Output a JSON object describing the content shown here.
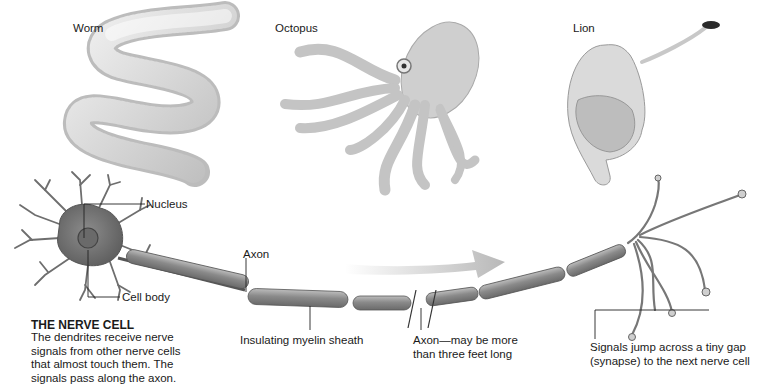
{
  "animals": {
    "worm": {
      "label": "Worm"
    },
    "octopus": {
      "label": "Octopus"
    },
    "lion": {
      "label": "Lion"
    }
  },
  "nerve_cell": {
    "labels": {
      "nucleus": "Nucleus",
      "cell_body": "Cell body",
      "axon": "Axon",
      "myelin": "Insulating myelin sheath",
      "axon_length_line1": "Axon—may be more",
      "axon_length_line2": "than three feet long",
      "synapse_line1": "Signals jump across a tiny gap",
      "synapse_line2": "(synapse) to the next nerve cell"
    },
    "caption": {
      "title": "THE NERVE CELL",
      "lines": [
        "The dendrites receive nerve",
        "signals from other nerve cells",
        "that almost touch them. The",
        "signals pass along the axon."
      ]
    }
  },
  "signal_arrow": {
    "direction": "right",
    "icon": "arrow-right-icon"
  },
  "colors": {
    "background": "#ffffff",
    "text": "#1a1a1a",
    "neuron": "#7a7a7a",
    "neuron_dark": "#555555",
    "animal": "#cfcfcf",
    "arrow": "#bdbdbd"
  }
}
